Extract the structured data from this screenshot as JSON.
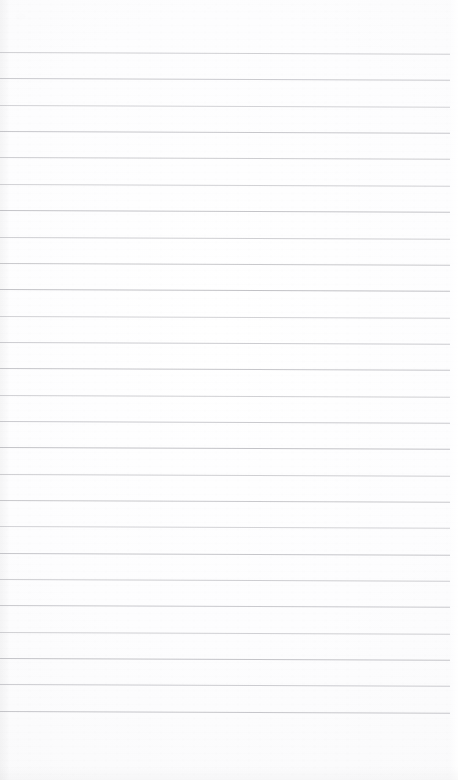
{
  "document": {
    "kind": "scanned-page",
    "title": "Blank Ruled Notepad Page",
    "page_label": "",
    "visible_text": "",
    "has_handwriting": false,
    "has_printed_text": false,
    "orientation": "portrait"
  },
  "canvas": {
    "width": 458,
    "height": 780
  },
  "paper": {
    "background_color": "#fdfdfd",
    "highlight_color": "#ffffff",
    "edge_tint_color": "#f3f3f5",
    "top_margin_px": 52,
    "bottom_margin_px": 50,
    "left_margin_px": 0,
    "right_margin_px": 8
  },
  "ruling": {
    "style": "wide-ruled-horizontal",
    "line_color": "#b4b4b9",
    "line_thickness_px": 1,
    "line_spacing_px": 26.35,
    "first_line_y_px": 52,
    "line_start_x_px": 0,
    "line_end_x_px": 450,
    "skew_deg": 0.22,
    "line_count": 26,
    "lines": [
      {
        "index": 1,
        "y": 52.0,
        "opacity": 0.62
      },
      {
        "index": 2,
        "y": 78.4,
        "opacity": 0.7
      },
      {
        "index": 3,
        "y": 104.7,
        "opacity": 0.58
      },
      {
        "index": 4,
        "y": 131.1,
        "opacity": 0.74
      },
      {
        "index": 5,
        "y": 157.4,
        "opacity": 0.66
      },
      {
        "index": 6,
        "y": 183.8,
        "opacity": 0.6
      },
      {
        "index": 7,
        "y": 210.1,
        "opacity": 0.78
      },
      {
        "index": 8,
        "y": 236.5,
        "opacity": 0.64
      },
      {
        "index": 9,
        "y": 262.8,
        "opacity": 0.72
      },
      {
        "index": 10,
        "y": 289.2,
        "opacity": 0.82
      },
      {
        "index": 11,
        "y": 315.5,
        "opacity": 0.6
      },
      {
        "index": 12,
        "y": 341.9,
        "opacity": 0.68
      },
      {
        "index": 13,
        "y": 368.2,
        "opacity": 0.76
      },
      {
        "index": 14,
        "y": 394.6,
        "opacity": 0.62
      },
      {
        "index": 15,
        "y": 420.9,
        "opacity": 0.7
      },
      {
        "index": 16,
        "y": 447.3,
        "opacity": 0.8
      },
      {
        "index": 17,
        "y": 473.6,
        "opacity": 0.64
      },
      {
        "index": 18,
        "y": 500.0,
        "opacity": 0.72
      },
      {
        "index": 19,
        "y": 526.3,
        "opacity": 0.58
      },
      {
        "index": 20,
        "y": 552.7,
        "opacity": 0.76
      },
      {
        "index": 21,
        "y": 579.0,
        "opacity": 0.66
      },
      {
        "index": 22,
        "y": 605.4,
        "opacity": 0.7
      },
      {
        "index": 23,
        "y": 631.7,
        "opacity": 0.62
      },
      {
        "index": 24,
        "y": 658.1,
        "opacity": 0.78
      },
      {
        "index": 25,
        "y": 684.4,
        "opacity": 0.68
      },
      {
        "index": 26,
        "y": 710.8,
        "opacity": 0.74
      }
    ]
  },
  "artifacts": {
    "smudges": [
      {
        "name": "top-left-smudge",
        "x": 14,
        "y": 13,
        "w": 13,
        "h": 7,
        "opacity": 0.3
      },
      {
        "name": "upper-mid-smudge",
        "x": 196,
        "y": 5,
        "w": 26,
        "h": 6,
        "opacity": 0.18
      },
      {
        "name": "right-edge-smudge",
        "x": 404,
        "y": 722,
        "w": 18,
        "h": 6,
        "opacity": 0.16
      }
    ]
  }
}
